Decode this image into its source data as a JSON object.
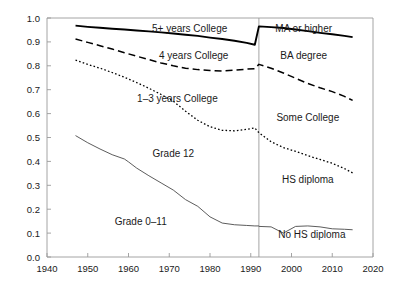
{
  "chart_data": {
    "type": "line",
    "title": "",
    "subtitle": "",
    "xlabel": "",
    "ylabel": "",
    "xlim": [
      1940,
      2020
    ],
    "ylim": [
      0.0,
      1.0
    ],
    "grid": false,
    "legend_position": "inline-annotations",
    "xticks": [
      "1940",
      "1950",
      "1960",
      "1970",
      "1980",
      "1990",
      "2000",
      "2010",
      "2020"
    ],
    "xtick_values": [
      1940,
      1950,
      1960,
      1970,
      1980,
      1990,
      2000,
      2010,
      2020
    ],
    "yticks": [
      "0.0",
      "0.1",
      "0.2",
      "0.3",
      "0.4",
      "0.5",
      "0.6",
      "0.7",
      "0.8",
      "0.9",
      "1.0"
    ],
    "ytick_values": [
      0.0,
      0.1,
      0.2,
      0.3,
      0.4,
      0.5,
      0.6,
      0.7,
      0.8,
      0.9,
      1.0
    ],
    "vertical_divider": {
      "x": 1992,
      "note": "survey redefinition break between old grade-attainment coding and new degree coding"
    },
    "annotations": [
      {
        "text": "5+ years College",
        "x": 1975,
        "y": 0.955,
        "series": "5-plus-years-college"
      },
      {
        "text": "4 years College",
        "x": 1976,
        "y": 0.845,
        "series": "4-years-college"
      },
      {
        "text": "1–3 years College",
        "x": 1972,
        "y": 0.665,
        "series": "1-3-years-college"
      },
      {
        "text": "Grade 12",
        "x": 1971,
        "y": 0.435,
        "series": "grade-12"
      },
      {
        "text": "Grade 0–11",
        "x": 1963,
        "y": 0.15,
        "series": "grade-0-11"
      },
      {
        "text": "MA or higher",
        "x": 2003,
        "y": 0.955,
        "series": "ma-or-higher"
      },
      {
        "text": "BA degree",
        "x": 2003,
        "y": 0.845,
        "series": "ba-degree"
      },
      {
        "text": "Some College",
        "x": 2004,
        "y": 0.585,
        "series": "some-college"
      },
      {
        "text": "HS diploma",
        "x": 2004,
        "y": 0.325,
        "series": "hs-diploma"
      },
      {
        "text": "No HS diploma",
        "x": 2005,
        "y": 0.095,
        "series": "no-hs-diploma"
      }
    ],
    "series": [
      {
        "name": "5+ years College",
        "label_left": "5+ years College",
        "label_right": "MA or higher",
        "style": "solid-thick",
        "color": "#000000",
        "x": [
          1947,
          1950,
          1953,
          1956,
          1959,
          1962,
          1965,
          1968,
          1971,
          1974,
          1977,
          1980,
          1983,
          1986,
          1989,
          1991,
          1992,
          1995,
          1998,
          2001,
          2004,
          2007,
          2010,
          2013,
          2015
        ],
        "values": [
          0.968,
          0.963,
          0.959,
          0.955,
          0.952,
          0.948,
          0.944,
          0.94,
          0.935,
          0.93,
          0.925,
          0.918,
          0.912,
          0.905,
          0.896,
          0.888,
          0.965,
          0.962,
          0.958,
          0.952,
          0.945,
          0.938,
          0.932,
          0.925,
          0.92
        ]
      },
      {
        "name": "4 years College",
        "label_left": "4 years College",
        "label_right": "BA degree",
        "style": "dashed",
        "color": "#000000",
        "x": [
          1947,
          1950,
          1953,
          1956,
          1959,
          1962,
          1965,
          1968,
          1971,
          1974,
          1977,
          1980,
          1983,
          1986,
          1989,
          1991,
          1992,
          1995,
          1998,
          2001,
          2004,
          2007,
          2010,
          2013,
          2015
        ],
        "values": [
          0.912,
          0.898,
          0.884,
          0.87,
          0.855,
          0.84,
          0.826,
          0.812,
          0.8,
          0.79,
          0.784,
          0.78,
          0.778,
          0.782,
          0.786,
          0.788,
          0.806,
          0.79,
          0.77,
          0.748,
          0.726,
          0.708,
          0.692,
          0.672,
          0.655
        ]
      },
      {
        "name": "1–3 years College",
        "label_left": "1–3 years College",
        "label_right": "Some College",
        "style": "dotted",
        "color": "#000000",
        "x": [
          1947,
          1950,
          1953,
          1956,
          1959,
          1962,
          1965,
          1968,
          1971,
          1974,
          1977,
          1980,
          1983,
          1986,
          1989,
          1991,
          1992,
          1995,
          1998,
          2001,
          2004,
          2007,
          2010,
          2013,
          2015
        ],
        "values": [
          0.824,
          0.806,
          0.79,
          0.772,
          0.752,
          0.73,
          0.706,
          0.68,
          0.652,
          0.61,
          0.572,
          0.545,
          0.53,
          0.528,
          0.534,
          0.54,
          0.52,
          0.482,
          0.458,
          0.442,
          0.424,
          0.408,
          0.392,
          0.37,
          0.352
        ]
      },
      {
        "name": "Grade 12",
        "label_left": "Grade 12",
        "label_right": "HS diploma",
        "style": "solid-thin",
        "color": "#4a4a4a",
        "x": [
          1947,
          1950,
          1953,
          1956,
          1959,
          1960,
          1962,
          1965,
          1968,
          1971,
          1974,
          1977,
          1980,
          1983,
          1986,
          1989,
          1991,
          1992
        ],
        "values": [
          0.508,
          0.478,
          0.452,
          0.428,
          0.41,
          0.398,
          0.372,
          0.34,
          0.31,
          0.28,
          0.24,
          0.212,
          0.168,
          0.142,
          0.135,
          0.132,
          0.13,
          0.13
        ]
      },
      {
        "name": "Grade 0–11",
        "label_left": "Grade 0–11",
        "label_right": "No HS diploma",
        "style": "solid-thin",
        "color": "#4a4a4a",
        "x": [
          1992,
          1995,
          1998,
          2001,
          2004,
          2007,
          2010,
          2013,
          2015
        ],
        "values": [
          0.128,
          0.126,
          0.1,
          0.128,
          0.13,
          0.126,
          0.118,
          0.116,
          0.114
        ]
      }
    ]
  }
}
